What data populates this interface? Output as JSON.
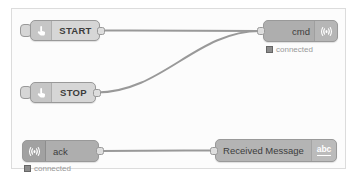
{
  "canvas": {
    "name": "node-red-flow-canvas"
  },
  "nodes": {
    "start": {
      "label": "START",
      "icon": "hand-pointer"
    },
    "stop": {
      "label": "STOP",
      "icon": "hand-pointer"
    },
    "cmd": {
      "label": "cmd",
      "icon": "broadcast",
      "status": "connected"
    },
    "ack": {
      "label": "ack",
      "icon": "broadcast",
      "status": "connected"
    },
    "received": {
      "label": "Received Message",
      "icon_text": "abc"
    }
  },
  "wires": [
    {
      "from": "start",
      "to": "cmd"
    },
    {
      "from": "stop",
      "to": "cmd"
    },
    {
      "from": "ack",
      "to": "received"
    }
  ],
  "colors": {
    "node_light": "#d6d6d6",
    "node_gray": "#aeaeae",
    "node_border": "#999999",
    "wire": "#999999",
    "status_dot": "#8c8c8c",
    "status_text": "#999999",
    "canvas_border": "#dcdcdc",
    "canvas_bg": "#fcfcfc"
  }
}
